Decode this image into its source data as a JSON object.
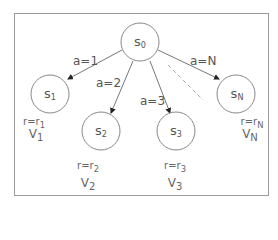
{
  "diagram": {
    "type": "tree",
    "root": {
      "id": "s0",
      "label": "s",
      "sub": "0"
    },
    "children": [
      {
        "id": "s1",
        "label": "s",
        "sub": "1",
        "action": "a=1",
        "reward_prefix": "r=r",
        "reward_sub": "1",
        "value_label": "V",
        "value_sub": "1"
      },
      {
        "id": "s2",
        "label": "s",
        "sub": "2",
        "action": "a=2",
        "reward_prefix": "r=r",
        "reward_sub": "2",
        "value_label": "V",
        "value_sub": "2"
      },
      {
        "id": "s3",
        "label": "s",
        "sub": "3",
        "action": "a=3",
        "reward_prefix": "r=r",
        "reward_sub": "3",
        "value_label": "V",
        "value_sub": "3"
      },
      {
        "id": "sN",
        "label": "s",
        "sub": "N",
        "action": "a=N",
        "reward_prefix": "r=r",
        "reward_sub": "N",
        "value_label": "V",
        "value_sub": "N"
      }
    ],
    "ellipsis_edge": "dashed",
    "colors": {
      "stroke": "#777777",
      "text": "#555555",
      "border": "#9a9a9a"
    }
  }
}
